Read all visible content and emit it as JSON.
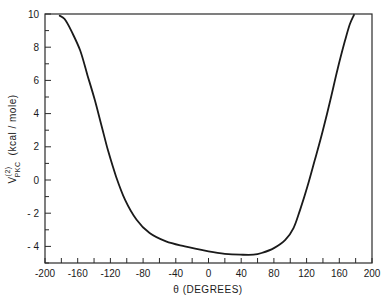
{
  "chart_data": {
    "type": "line",
    "title": "",
    "xlabel": "θ (DEGREES)",
    "ylabel": "V(2)PKC (kcal / mole)",
    "ylabel_parts": {
      "main": "V",
      "superscript": "(2)",
      "subscript": "PKC",
      "units": "(kcal / mole)"
    },
    "xlim": [
      -200,
      200
    ],
    "ylim": [
      -5,
      10
    ],
    "x_ticks": [
      -200,
      -160,
      -120,
      -80,
      -40,
      0,
      40,
      80,
      120,
      160,
      200
    ],
    "x_tick_labels": [
      "-200",
      "-160",
      "-120",
      "-80",
      "-40",
      "0",
      "40",
      "80",
      "120",
      "160",
      "200"
    ],
    "y_ticks": [
      -4,
      -2,
      0,
      2,
      4,
      6,
      8,
      10
    ],
    "y_tick_labels": [
      "- 4",
      "- 2",
      "0",
      "2",
      "4",
      "6",
      "8",
      "10"
    ],
    "grid": false,
    "legend": null,
    "series": [
      {
        "name": "V(2)PKC",
        "color": "#1a1a1a",
        "x": [
          -182,
          -176,
          -168,
          -157,
          -148,
          -139,
          -131,
          -123,
          -113,
          -102,
          -88,
          -72,
          -52,
          -29,
          0,
          20,
          39,
          55,
          65,
          80,
          94,
          104,
          112,
          121,
          130,
          140,
          149,
          158,
          167,
          173,
          178
        ],
        "y": [
          9.9,
          9.7,
          9.0,
          7.8,
          6.3,
          4.8,
          3.3,
          1.8,
          0.2,
          -1.2,
          -2.4,
          -3.2,
          -3.7,
          -4.0,
          -4.3,
          -4.45,
          -4.5,
          -4.5,
          -4.4,
          -4.1,
          -3.6,
          -2.9,
          -1.8,
          -0.4,
          1.2,
          3.0,
          4.8,
          6.7,
          8.4,
          9.4,
          9.95
        ]
      }
    ]
  },
  "plot": {
    "left": 45,
    "right": 372,
    "top": 14,
    "bottom": 263,
    "line_color": "#1a1a1a",
    "axis_color": "#2a2a2a"
  }
}
